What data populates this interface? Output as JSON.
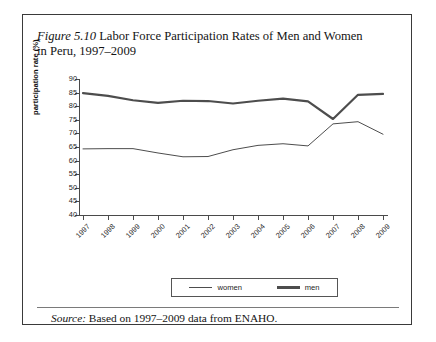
{
  "figure": {
    "label": "Figure 5.10",
    "title": " Labor Force Participation Rates of Men and Women in Peru, 1997–2009",
    "source_label": "Source:",
    "source_text": " Based on 1997–2009 data from ENAHO."
  },
  "legend": {
    "women_label": "women",
    "men_label": "men"
  },
  "colors": {
    "line": "#4d4d4d",
    "axis": "#4a4a4a",
    "border": "#3a3a3a",
    "text": "#141414"
  },
  "chart_data": {
    "type": "line",
    "title": "Labor Force Participation Rates of Men and Women in Peru, 1997–2009",
    "xlabel": "",
    "ylabel": "participation rate (%)",
    "categories": [
      "1997",
      "1998",
      "1999",
      "2000",
      "2001",
      "2002",
      "2003",
      "2004",
      "2005",
      "2006",
      "2007",
      "2008",
      "2009"
    ],
    "ylim": [
      40,
      90
    ],
    "yticks": [
      40,
      45,
      50,
      55,
      60,
      65,
      70,
      75,
      80,
      85,
      90
    ],
    "grid": false,
    "legend_position": "bottom",
    "series": [
      {
        "name": "women",
        "values": [
          64.3,
          64.4,
          64.4,
          62.8,
          61.4,
          61.5,
          64.0,
          65.6,
          66.2,
          65.4,
          73.5,
          74.3,
          69.7
        ],
        "style": "thin"
      },
      {
        "name": "men",
        "values": [
          84.8,
          83.8,
          82.2,
          81.2,
          82.0,
          81.9,
          81.0,
          82.0,
          82.8,
          81.8,
          75.3,
          84.2,
          84.5
        ],
        "style": "thick"
      }
    ]
  }
}
